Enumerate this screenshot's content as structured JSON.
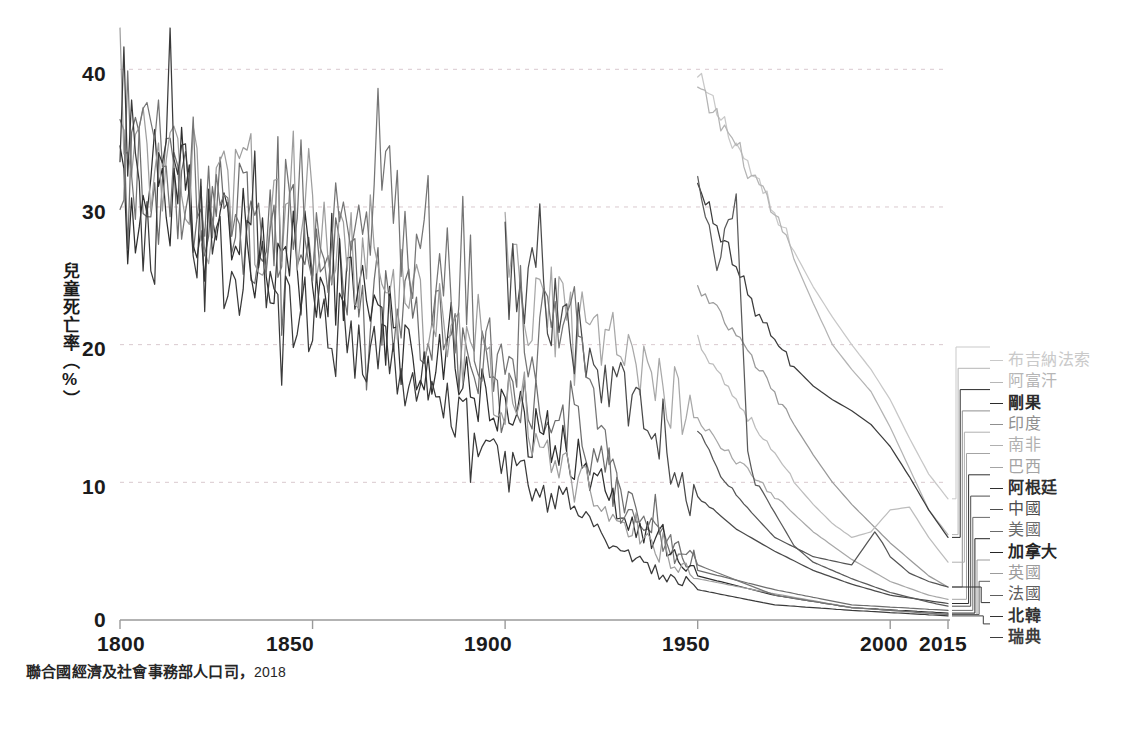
{
  "caption": {
    "source": "聯合國經濟及社會事務部人口司",
    "separator": "，",
    "year": "2018"
  },
  "axes": {
    "ylabel": "兒童死亡率（%）",
    "yticks": [
      "0",
      "10",
      "20",
      "30",
      "40"
    ],
    "xticks": [
      "1800",
      "1850",
      "1900",
      "1950",
      "2000",
      "2015"
    ]
  },
  "chart_data": {
    "type": "line",
    "title": "",
    "xlabel": "",
    "ylabel": "兒童死亡率（%）",
    "xlim": [
      1800,
      2015
    ],
    "ylim": [
      0,
      43
    ],
    "yticks": [
      0,
      10,
      20,
      30,
      40
    ],
    "xticks": [
      1800,
      1850,
      1900,
      1950,
      2000,
      2015
    ],
    "grid": "horizontal-dashed",
    "legend_position": "right-outside",
    "series": [
      {
        "name": "布吉納法索",
        "color": "#c8c8c8",
        "x": [
          1950,
          1955,
          1960,
          1965,
          1970,
          1975,
          1980,
          1985,
          1990,
          1995,
          2000,
          2005,
          2010,
          2015
        ],
        "values": [
          39.2,
          37.0,
          34.6,
          32.0,
          29.4,
          26.8,
          24.2,
          22.0,
          20.0,
          18.2,
          16.0,
          13.2,
          10.6,
          8.8
        ]
      },
      {
        "name": "阿富汗",
        "color": "#b4b4b4",
        "x": [
          1950,
          1955,
          1960,
          1965,
          1970,
          1975,
          1980,
          1985,
          1990,
          1995,
          2000,
          2005,
          2010,
          2015
        ],
        "values": [
          38.4,
          36.5,
          34.4,
          31.8,
          29.2,
          26.2,
          23.0,
          20.0,
          18.2,
          16.6,
          14.0,
          11.0,
          8.0,
          6.2
        ]
      },
      {
        "name": "剛果",
        "color": "#3c3c3c",
        "x": [
          1950,
          1955,
          1960,
          1965,
          1970,
          1975,
          1980,
          1985,
          1990,
          1995,
          2000,
          2005,
          2010,
          2015
        ],
        "values": [
          31.4,
          28.8,
          25.6,
          22.6,
          20.2,
          18.4,
          17.0,
          16.0,
          15.2,
          14.2,
          12.6,
          10.4,
          8.0,
          6.0
        ]
      },
      {
        "name": "印度",
        "color": "#9a9a9a",
        "x": [
          1950,
          1955,
          1960,
          1965,
          1970,
          1975,
          1980,
          1985,
          1990,
          1995,
          2000,
          2005,
          2010,
          2015
        ],
        "values": [
          24.0,
          22.4,
          20.6,
          18.6,
          16.4,
          14.2,
          12.0,
          10.0,
          8.4,
          7.0,
          5.6,
          4.4,
          3.2,
          2.4
        ]
      },
      {
        "name": "南非",
        "color": "#bdbdbd",
        "x": [
          1950,
          1955,
          1960,
          1965,
          1970,
          1975,
          1980,
          1985,
          1990,
          1995,
          2000,
          2005,
          2010,
          2015
        ],
        "values": [
          20.4,
          18.2,
          16.0,
          14.0,
          12.0,
          10.0,
          8.4,
          7.0,
          6.0,
          6.4,
          8.0,
          8.2,
          6.0,
          4.2
        ]
      },
      {
        "name": "巴西",
        "color": "#a8a8a8",
        "x": [
          1900,
          1920,
          1940,
          1950,
          1960,
          1970,
          1980,
          1990,
          2000,
          2010,
          2015
        ],
        "values": [
          24.0,
          21.0,
          17.2,
          14.4,
          11.6,
          9.0,
          6.4,
          4.4,
          2.8,
          1.8,
          1.5
        ]
      },
      {
        "name": "阿根廷",
        "color": "#4a4a4a",
        "x": [
          1900,
          1920,
          1940,
          1950,
          1960,
          1970,
          1980,
          1990,
          2000,
          2010,
          2015
        ],
        "values": [
          26.0,
          20.4,
          12.6,
          9.0,
          6.6,
          5.0,
          3.6,
          2.6,
          1.8,
          1.4,
          1.2
        ]
      },
      {
        "name": "中國",
        "color": "#5a5a5a",
        "x": [
          1950,
          1955,
          1960,
          1963,
          1965,
          1970,
          1975,
          1980,
          1990,
          2000,
          2010,
          2015
        ],
        "values": [
          31.6,
          26.0,
          30.8,
          12.0,
          10.0,
          7.8,
          5.4,
          4.2,
          3.0,
          2.0,
          1.3,
          1.0
        ]
      },
      {
        "name": "美國",
        "color": "#6e6e6e",
        "x": [
          1800,
          1850,
          1880,
          1900,
          1918,
          1930,
          1950,
          1970,
          1990,
          2015
        ],
        "values": [
          32.0,
          27.0,
          21.5,
          17.0,
          14.0,
          9.0,
          3.6,
          2.2,
          1.1,
          0.7
        ]
      },
      {
        "name": "加拿大",
        "color": "#2f2f2f",
        "x": [
          1800,
          1850,
          1880,
          1900,
          1918,
          1930,
          1950,
          1970,
          1990,
          2015
        ],
        "values": [
          30.0,
          26.0,
          19.0,
          15.0,
          12.0,
          8.0,
          3.2,
          1.8,
          0.9,
          0.5
        ]
      },
      {
        "name": "英國",
        "color": "#9e9e9e",
        "x": [
          1800,
          1850,
          1880,
          1900,
          1918,
          1930,
          1950,
          1970,
          1990,
          2015
        ],
        "values": [
          33.0,
          28.0,
          22.0,
          16.0,
          11.0,
          6.8,
          3.0,
          1.9,
          0.9,
          0.4
        ]
      },
      {
        "name": "法國",
        "color": "#757575",
        "x": [
          1800,
          1850,
          1870,
          1900,
          1918,
          1930,
          1950,
          1970,
          1990,
          2015
        ],
        "values": [
          35.0,
          27.0,
          30.0,
          17.5,
          24.0,
          8.0,
          4.0,
          1.8,
          0.9,
          0.4
        ]
      },
      {
        "name": "北韓",
        "color": "#555555",
        "x": [
          1950,
          1955,
          1960,
          1970,
          1980,
          1990,
          1993,
          1996,
          1998,
          2000,
          2005,
          2010,
          2015
        ],
        "values": [
          14.0,
          11.0,
          9.0,
          6.0,
          4.6,
          4.0,
          5.2,
          6.4,
          5.6,
          4.6,
          3.4,
          2.8,
          2.4
        ]
      },
      {
        "name": "瑞典",
        "color": "#3a3a3a",
        "x": [
          1800,
          1808,
          1812,
          1820,
          1850,
          1880,
          1900,
          1918,
          1930,
          1950,
          1970,
          1990,
          2015
        ],
        "values": [
          38.0,
          25.5,
          36.5,
          28.0,
          22.0,
          17.0,
          11.0,
          7.5,
          5.0,
          2.2,
          1.1,
          0.7,
          0.3
        ]
      }
    ]
  },
  "legend": {
    "items": [
      {
        "label": "布吉納法索",
        "color": "#c9c9c9",
        "weight": "400"
      },
      {
        "label": "阿富汗",
        "color": "#b6b6b6",
        "weight": "400"
      },
      {
        "label": "剛果",
        "color": "#2b2b2b",
        "weight": "700"
      },
      {
        "label": "印度",
        "color": "#8f8f8f",
        "weight": "400"
      },
      {
        "label": "南非",
        "color": "#b0b0b0",
        "weight": "400"
      },
      {
        "label": "巴西",
        "color": "#a4a4a4",
        "weight": "400"
      },
      {
        "label": "阿根廷",
        "color": "#2f2f2f",
        "weight": "700"
      },
      {
        "label": "中國",
        "color": "#4d4d4d",
        "weight": "500"
      },
      {
        "label": "美國",
        "color": "#6b6b6b",
        "weight": "400"
      },
      {
        "label": "加拿大",
        "color": "#262626",
        "weight": "700"
      },
      {
        "label": "英國",
        "color": "#9c9c9c",
        "weight": "400"
      },
      {
        "label": "法國",
        "color": "#5e5e5e",
        "weight": "500"
      },
      {
        "label": "北韓",
        "color": "#333333",
        "weight": "700"
      },
      {
        "label": "瑞典",
        "color": "#3d3d3d",
        "weight": "600"
      }
    ]
  },
  "style": {
    "background": "#ffffff",
    "axis_color": "#9a9a9a",
    "grid_color": "#d9c9cf",
    "tick_text_color": "#1b1b1b"
  }
}
